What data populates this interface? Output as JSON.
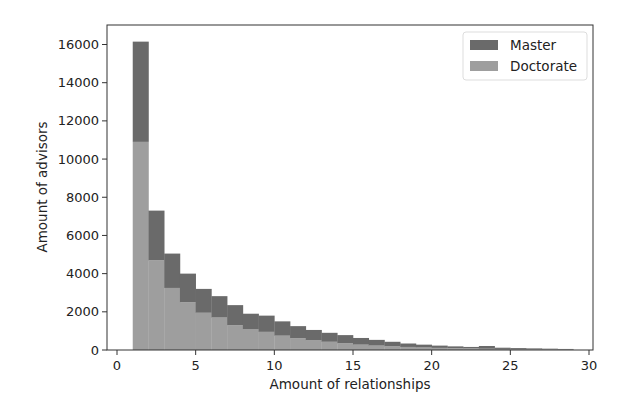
{
  "chart_data": {
    "type": "bar",
    "stacked": true,
    "histogram": true,
    "title": "",
    "xlabel": "Amount of relationships",
    "ylabel": "Amount of advisors",
    "xlim": [
      -1.0,
      30.5
    ],
    "ylim": [
      0,
      16900
    ],
    "xticks": [
      0,
      5,
      10,
      15,
      20,
      25,
      30
    ],
    "yticks": [
      0,
      2000,
      4000,
      6000,
      8000,
      10000,
      12000,
      14000,
      16000
    ],
    "grid": false,
    "legend_position": "upper right",
    "bin_edges": [
      1,
      2,
      3,
      4,
      5,
      6,
      7,
      8,
      9,
      10,
      11,
      12,
      13,
      14,
      15,
      16,
      17,
      18,
      19,
      20,
      21,
      22,
      23,
      24,
      25,
      26,
      27,
      28,
      29
    ],
    "series": [
      {
        "name": "Doctorate",
        "color": "#9e9e9e",
        "values": [
          10900,
          4700,
          3250,
          2500,
          1950,
          1700,
          1300,
          1100,
          950,
          750,
          620,
          520,
          430,
          350,
          280,
          230,
          190,
          160,
          130,
          110,
          90,
          80,
          65,
          55,
          45,
          38,
          30,
          25
        ]
      },
      {
        "name": "Master",
        "color": "#6a6a6a",
        "stacked_totals": [
          16150,
          7300,
          5050,
          4000,
          3200,
          2820,
          2350,
          1900,
          1800,
          1500,
          1250,
          1050,
          900,
          780,
          630,
          530,
          430,
          340,
          280,
          230,
          190,
          160,
          210,
          120,
          100,
          85,
          70,
          55
        ],
        "values": [
          5250,
          2600,
          1800,
          1500,
          1250,
          1120,
          1050,
          800,
          850,
          750,
          630,
          530,
          470,
          430,
          350,
          300,
          240,
          180,
          150,
          120,
          100,
          80,
          145,
          65,
          55,
          47,
          40,
          30
        ]
      }
    ]
  },
  "legend": {
    "items": [
      {
        "label": "Master",
        "color": "#6a6a6a"
      },
      {
        "label": "Doctorate",
        "color": "#9e9e9e"
      }
    ]
  }
}
